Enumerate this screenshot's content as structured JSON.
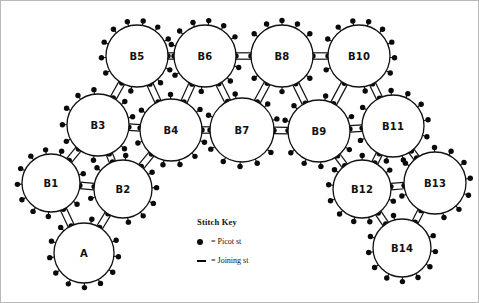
{
  "diagram": {
    "type": "ring-motif-layout",
    "rings": [
      {
        "id": "A",
        "label": "A",
        "cx": 83,
        "cy": 252,
        "r": 30,
        "picots": 13,
        "picot_start_deg": 200
      },
      {
        "id": "B1",
        "label": "B1",
        "cx": 50,
        "cy": 182,
        "r": 29,
        "picots": 13,
        "picot_start_deg": 150
      },
      {
        "id": "B2",
        "label": "B2",
        "cx": 122,
        "cy": 188,
        "r": 29,
        "picots": 13,
        "picot_start_deg": 330
      },
      {
        "id": "B3",
        "label": "B3",
        "cx": 97,
        "cy": 124,
        "r": 31,
        "picots": 13,
        "picot_start_deg": 125
      },
      {
        "id": "B4",
        "label": "B4",
        "cx": 170,
        "cy": 129,
        "r": 31,
        "picots": 13,
        "picot_start_deg": 20
      },
      {
        "id": "B5",
        "label": "B5",
        "cx": 136,
        "cy": 55,
        "r": 31,
        "picots": 14,
        "picot_start_deg": 100
      },
      {
        "id": "B6",
        "label": "B6",
        "cx": 204,
        "cy": 55,
        "r": 31,
        "picots": 14,
        "picot_start_deg": 96
      },
      {
        "id": "B7",
        "label": "B7",
        "cx": 241,
        "cy": 129,
        "r": 32,
        "picots": 13,
        "picot_start_deg": 10
      },
      {
        "id": "B8",
        "label": "B8",
        "cx": 281,
        "cy": 55,
        "r": 31,
        "picots": 14,
        "picot_start_deg": 90
      },
      {
        "id": "B9",
        "label": "B9",
        "cx": 318,
        "cy": 130,
        "r": 31,
        "picots": 13,
        "picot_start_deg": 170
      },
      {
        "id": "B10",
        "label": "B10",
        "cx": 358,
        "cy": 55,
        "r": 31,
        "picots": 14,
        "picot_start_deg": 80
      },
      {
        "id": "B11",
        "label": "B11",
        "cx": 392,
        "cy": 125,
        "r": 31,
        "picots": 13,
        "picot_start_deg": 350
      },
      {
        "id": "B12",
        "label": "B12",
        "cx": 361,
        "cy": 188,
        "r": 29,
        "picots": 13,
        "picot_start_deg": 215
      },
      {
        "id": "B13",
        "label": "B13",
        "cx": 434,
        "cy": 182,
        "r": 31,
        "picots": 13,
        "picot_start_deg": 20
      },
      {
        "id": "B14",
        "label": "B14",
        "cx": 401,
        "cy": 247,
        "r": 29,
        "picots": 13,
        "picot_start_deg": 200
      }
    ],
    "joins": [
      {
        "from": "A",
        "to": "B1"
      },
      {
        "from": "A",
        "to": "B2"
      },
      {
        "from": "B1",
        "to": "B2"
      },
      {
        "from": "B1",
        "to": "B3"
      },
      {
        "from": "B2",
        "to": "B3"
      },
      {
        "from": "B2",
        "to": "B4"
      },
      {
        "from": "B3",
        "to": "B4"
      },
      {
        "from": "B3",
        "to": "B5"
      },
      {
        "from": "B4",
        "to": "B5"
      },
      {
        "from": "B4",
        "to": "B6"
      },
      {
        "from": "B4",
        "to": "B7"
      },
      {
        "from": "B5",
        "to": "B6"
      },
      {
        "from": "B6",
        "to": "B7"
      },
      {
        "from": "B6",
        "to": "B8"
      },
      {
        "from": "B7",
        "to": "B8"
      },
      {
        "from": "B7",
        "to": "B9"
      },
      {
        "from": "B8",
        "to": "B9"
      },
      {
        "from": "B8",
        "to": "B10"
      },
      {
        "from": "B9",
        "to": "B10"
      },
      {
        "from": "B9",
        "to": "B11"
      },
      {
        "from": "B10",
        "to": "B11"
      },
      {
        "from": "B9",
        "to": "B12"
      },
      {
        "from": "B11",
        "to": "B12"
      },
      {
        "from": "B11",
        "to": "B13"
      },
      {
        "from": "B12",
        "to": "B13"
      },
      {
        "from": "B12",
        "to": "B14"
      },
      {
        "from": "B13",
        "to": "B14"
      }
    ],
    "colors": {
      "stroke": "#111111",
      "picot": "#0a0a0a",
      "background": "#ffffff",
      "border": "#b9b9b9"
    }
  },
  "legend": {
    "title": "Stitch Key",
    "items": [
      {
        "glyph": "picot-dot-icon",
        "text": "= Picot st"
      },
      {
        "glyph": "joining-dash-icon",
        "text": "= Joining st"
      }
    ]
  }
}
